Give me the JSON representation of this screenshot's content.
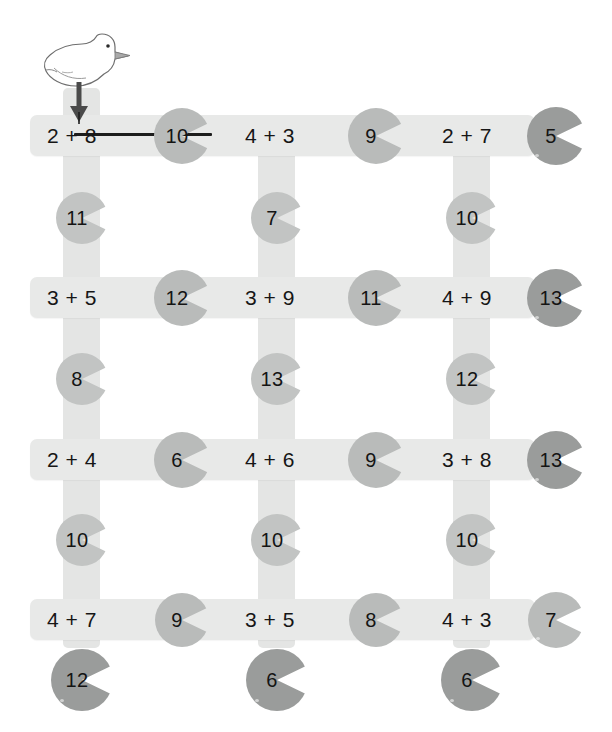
{
  "worksheet": {
    "title": "Goose addition lily-pad path maze",
    "colors": {
      "bar": "#e8e9e8",
      "pad_light": "#c2c4c3",
      "pad_mid": "#b9bbba",
      "pad_dark": "#9a9c9b",
      "text": "#141414",
      "drawn_mark": "#1d1d1d"
    },
    "goose": {
      "icon": "goose-icon",
      "description": "white goose outline facing right with gray beak"
    },
    "student_marks": {
      "arrow": "down-arrow",
      "line_from": "2 + 8",
      "line_to": "10"
    }
  },
  "rows": [
    {
      "row_id": "row-1",
      "equations": [
        "2 + 8",
        "4 + 3",
        "2 + 7"
      ],
      "inline_pads": [
        "10",
        "9"
      ],
      "end_pad": "5"
    },
    {
      "row_id": "row-2",
      "equations": [
        "3 + 5",
        "3 + 9",
        "4 + 9"
      ],
      "inline_pads": [
        "12",
        "11"
      ],
      "end_pad": "13"
    },
    {
      "row_id": "row-3",
      "equations": [
        "2 + 4",
        "4 + 6",
        "3 + 8"
      ],
      "inline_pads": [
        "6",
        "9"
      ],
      "end_pad": "13"
    },
    {
      "row_id": "row-4",
      "equations": [
        "4 + 7",
        "3 + 5",
        "4 + 3"
      ],
      "inline_pads": [
        "9",
        "8"
      ],
      "end_pad": "7"
    }
  ],
  "connector_pads": [
    {
      "band_id": "band-1",
      "values": [
        "11",
        "7",
        "10"
      ]
    },
    {
      "band_id": "band-2",
      "values": [
        "8",
        "13",
        "12"
      ]
    },
    {
      "band_id": "band-3",
      "values": [
        "10",
        "10",
        "10"
      ]
    }
  ],
  "bottom_pads": [
    "12",
    "6",
    "6"
  ]
}
